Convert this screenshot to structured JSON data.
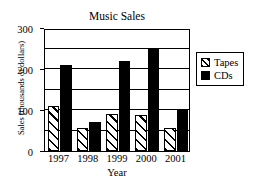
{
  "chart_data": {
    "type": "bar",
    "title": "Music Sales",
    "xlabel": "Year",
    "ylabel": "Sales (thousands of dollars)",
    "categories": [
      "1997",
      "1998",
      "1999",
      "2000",
      "2001"
    ],
    "series": [
      {
        "name": "Tapes",
        "values": [
          110,
          55,
          90,
          88,
          55
        ],
        "fill": "diagonal-hatch"
      },
      {
        "name": "CDs",
        "values": [
          210,
          70,
          220,
          250,
          100
        ],
        "fill": "solid-black"
      }
    ],
    "ylim": [
      0,
      300
    ],
    "ytick_labels": [
      "0",
      "100",
      "200",
      "300"
    ],
    "ytick_values": [
      0,
      100,
      200,
      300
    ],
    "gridline_values": [
      50,
      100,
      150,
      200,
      250
    ],
    "grid": true,
    "legend_position": "right",
    "colors": {
      "axis": "#000000",
      "grid": "#000000",
      "cds": "#000000",
      "tapes_background": "#ffffff",
      "plot_background": "#ffffff"
    }
  },
  "legend": {
    "entries": [
      {
        "label": "Tapes"
      },
      {
        "label": "CDs"
      }
    ]
  }
}
